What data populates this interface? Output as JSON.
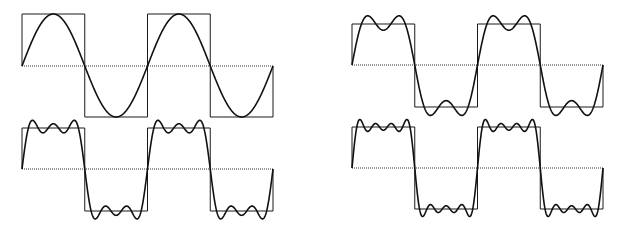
{
  "figure": {
    "colors": {
      "background": "#ffffff",
      "stroke": "#111111"
    },
    "panels": [
      {
        "id": "top-left",
        "harmonics": [
          1
        ],
        "x0": 22,
        "x1": 273,
        "top": 14,
        "mid": 66,
        "bottom": 117,
        "scale": "unit"
      },
      {
        "id": "top-right",
        "harmonics": [
          1,
          3
        ],
        "x0": 352,
        "x1": 603,
        "top": 24,
        "mid": 65,
        "bottom": 107,
        "scale": "fourier"
      },
      {
        "id": "bottom-left",
        "harmonics": [
          1,
          3,
          5
        ],
        "x0": 22,
        "x1": 273,
        "top": 128,
        "mid": 169,
        "bottom": 211,
        "scale": "fourier"
      },
      {
        "id": "bottom-right",
        "harmonics": [
          1,
          3,
          5,
          7
        ],
        "x0": 352,
        "x1": 603,
        "top": 127,
        "mid": 168,
        "bottom": 209,
        "scale": "fourier"
      }
    ],
    "periods_shown": 2
  }
}
